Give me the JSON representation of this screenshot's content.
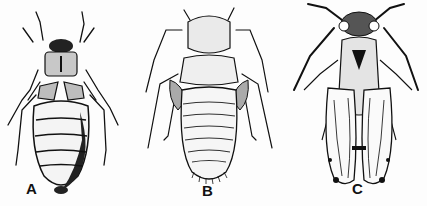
{
  "figure": {
    "panels": [
      {
        "label": "A",
        "subject": "wingless flattened insect with segmented oval abdomen"
      },
      {
        "label": "B",
        "subject": "wingless elongated nymph with segmented abdomen and bristly tip"
      },
      {
        "label": "C",
        "subject": "winged insect with long antennae and spotted wing tips"
      }
    ]
  },
  "colors": {
    "ink": "#111111",
    "paper": "#fdfdfd",
    "shade": "#9a9a9a"
  }
}
